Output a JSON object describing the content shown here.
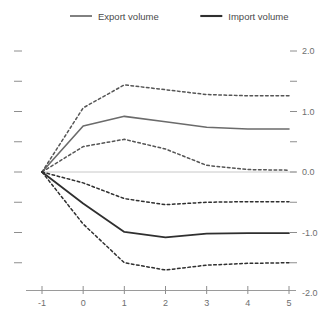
{
  "chart_data": {
    "type": "line",
    "title": "",
    "subtitle": "",
    "xlabel": "",
    "ylabel": "",
    "xlim": [
      -1,
      5
    ],
    "ylim": [
      -2.0,
      2.0
    ],
    "grid": false,
    "zero_line": true,
    "legend_position": "top",
    "x": [
      -1,
      0,
      1,
      2,
      3,
      4,
      5
    ],
    "xticks": [
      -1,
      0,
      1,
      2,
      3,
      4,
      5
    ],
    "xticklabels": [
      "-1",
      "0",
      "1",
      "2",
      "3",
      "4",
      "5"
    ],
    "yticks": [
      -2.0,
      -1.0,
      0.0,
      1.0,
      2.0
    ],
    "yticklabels": [
      "-2.0",
      "-1.0",
      "0.0",
      "1.0",
      "2.0"
    ],
    "yminorticks": [
      -1.5,
      -0.5,
      0.5,
      1.5
    ],
    "series": [
      {
        "name": "Export volume",
        "style": "solid",
        "color": "#6b6b6b",
        "width": 1.6,
        "values": [
          0.0,
          0.76,
          0.92,
          0.83,
          0.74,
          0.71,
          0.71
        ]
      },
      {
        "name": "Export volume upper band",
        "style": "dashed",
        "color": "#555555",
        "width": 1.5,
        "values": [
          0.0,
          1.06,
          1.44,
          1.36,
          1.28,
          1.26,
          1.26
        ]
      },
      {
        "name": "Export volume lower band",
        "style": "dashed",
        "color": "#555555",
        "width": 1.5,
        "values": [
          0.0,
          0.42,
          0.54,
          0.38,
          0.11,
          0.04,
          0.03
        ]
      },
      {
        "name": "Import volume",
        "style": "solid",
        "color": "#2f2f2f",
        "width": 1.8,
        "values": [
          0.0,
          -0.52,
          -0.99,
          -1.08,
          -1.02,
          -1.01,
          -1.01
        ]
      },
      {
        "name": "Import volume upper band",
        "style": "dashed",
        "color": "#2f2f2f",
        "width": 1.5,
        "values": [
          0.0,
          -0.18,
          -0.44,
          -0.54,
          -0.5,
          -0.49,
          -0.49
        ]
      },
      {
        "name": "Import volume lower band",
        "style": "dashed",
        "color": "#2f2f2f",
        "width": 1.5,
        "values": [
          0.0,
          -0.86,
          -1.5,
          -1.62,
          -1.54,
          -1.51,
          -1.5
        ]
      }
    ],
    "legend": [
      {
        "label": "Export volume",
        "color": "#6b6b6b",
        "width": 1.7,
        "style": "solid"
      },
      {
        "label": "Import volume",
        "color": "#2f2f2f",
        "width": 2.1,
        "style": "solid"
      }
    ],
    "axis_color": "#9a9a9a",
    "zero_line_color": "#c8c8c8",
    "tick_color": "#8e8e8e",
    "background": "#ffffff"
  }
}
